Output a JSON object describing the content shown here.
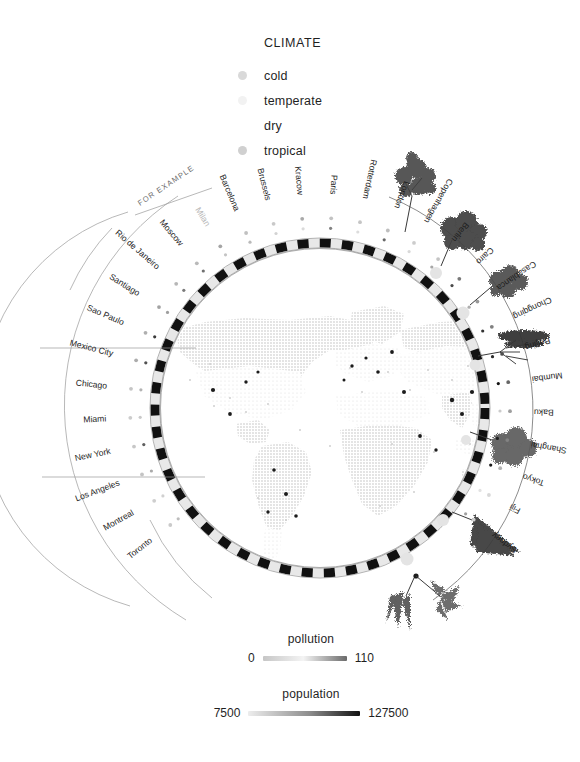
{
  "legend": {
    "title": "CLIMATE",
    "items": [
      {
        "label": "cold",
        "color": "#d9d9d9"
      },
      {
        "label": "temperate",
        "color": "#f2f2f2"
      },
      {
        "label": "dry",
        "color": "#ffffff"
      },
      {
        "label": "tropical",
        "color": "#d0d0d0"
      }
    ]
  },
  "annotation": {
    "for_example": "FOR EXAMPLE"
  },
  "scales": [
    {
      "id": "pollution",
      "caption": "pollution",
      "min_label": "0",
      "max_label": "110",
      "min_value": 0,
      "max_value": 110,
      "gradient_from": "#c6c6c6",
      "gradient_mid": "#f4f4f4",
      "gradient_to": "#6a6a6a"
    },
    {
      "id": "population",
      "caption": "population",
      "min_label": "7500",
      "max_label": "127500",
      "min_value": 7500,
      "max_value": 127500,
      "gradient_from": "#ededed",
      "gradient_mid": "#8d8d8d",
      "gradient_to": "#111111"
    }
  ],
  "chart_data": {
    "type": "radial-map",
    "title": "",
    "center": {
      "x": 320,
      "y": 408
    },
    "ring_radius": 165,
    "legend_position": "top-center",
    "grid": false,
    "metrics": [
      "pollution",
      "population",
      "climate"
    ],
    "cities": [
      {
        "name": "Toronto",
        "group": "Americas",
        "climate": "cold",
        "pollution": 14,
        "population": 29000,
        "dim": false
      },
      {
        "name": "Montreal",
        "group": "Americas",
        "climate": "cold",
        "pollution": 12,
        "population": 18000,
        "dim": false
      },
      {
        "name": "Los Angeles",
        "group": "Americas",
        "climate": "dry",
        "pollution": 18,
        "population": 40000,
        "dim": false
      },
      {
        "name": "New York",
        "group": "Americas",
        "climate": "temperate",
        "pollution": 16,
        "population": 84000,
        "dim": false
      },
      {
        "name": "Miami",
        "group": "Americas",
        "climate": "tropical",
        "pollution": 13,
        "population": 22000,
        "dim": false
      },
      {
        "name": "Chicago",
        "group": "Americas",
        "climate": "cold",
        "pollution": 17,
        "population": 35000,
        "dim": false
      },
      {
        "name": "Mexico City",
        "group": "Americas",
        "climate": "dry",
        "pollution": 32,
        "population": 92000,
        "dim": false
      },
      {
        "name": "Sao Paulo",
        "group": "Americas",
        "climate": "tropical",
        "pollution": 30,
        "population": 105000,
        "dim": false
      },
      {
        "name": "Santiago",
        "group": "Americas",
        "climate": "dry",
        "pollution": 38,
        "population": 47000,
        "dim": false
      },
      {
        "name": "Rio de Janeiro",
        "group": "Americas",
        "climate": "tropical",
        "pollution": 26,
        "population": 68000,
        "dim": false
      },
      {
        "name": "Moscow",
        "group": "Europe",
        "climate": "cold",
        "pollution": 24,
        "population": 74000,
        "dim": false
      },
      {
        "name": "Milan",
        "group": "Europe",
        "climate": "temperate",
        "pollution": 36,
        "population": 25000,
        "dim": true
      },
      {
        "name": "Barcelona",
        "group": "Europe",
        "climate": "temperate",
        "pollution": 20,
        "population": 31000,
        "dim": false
      },
      {
        "name": "Brussels",
        "group": "Europe",
        "climate": "temperate",
        "pollution": 15,
        "population": 17000,
        "dim": false
      },
      {
        "name": "Kracow",
        "group": "Europe",
        "climate": "cold",
        "pollution": 34,
        "population": 12000,
        "dim": false
      },
      {
        "name": "Paris",
        "group": "Europe",
        "climate": "temperate",
        "pollution": 19,
        "population": 64000,
        "dim": false
      },
      {
        "name": "Rotterdam",
        "group": "Europe",
        "climate": "temperate",
        "pollution": 17,
        "population": 11000,
        "dim": false
      },
      {
        "name": "London",
        "group": "Europe",
        "climate": "temperate",
        "pollution": 21,
        "population": 78000,
        "dim": false
      },
      {
        "name": "Copenhagen",
        "group": "Europe",
        "climate": "cold",
        "pollution": 13,
        "population": 13000,
        "dim": false
      },
      {
        "name": "Berlin",
        "group": "Europe",
        "climate": "temperate",
        "pollution": 18,
        "population": 42000,
        "dim": false
      },
      {
        "name": "Cairo",
        "group": "Africa-Asia",
        "climate": "dry",
        "pollution": 62,
        "population": 96000,
        "dim": false
      },
      {
        "name": "Casablanca",
        "group": "Africa-Asia",
        "climate": "dry",
        "pollution": 44,
        "population": 38000,
        "dim": false
      },
      {
        "name": "Chongqing",
        "group": "Africa-Asia",
        "climate": "temperate",
        "pollution": 58,
        "population": 110000,
        "dim": false
      },
      {
        "name": "Beijing",
        "group": "Africa-Asia",
        "climate": "dry",
        "pollution": 88,
        "population": 115000,
        "dim": false
      },
      {
        "name": "Mumbai",
        "group": "Africa-Asia",
        "climate": "tropical",
        "pollution": 74,
        "population": 127500,
        "dim": false
      },
      {
        "name": "Baku",
        "group": "Africa-Asia",
        "climate": "dry",
        "pollution": 40,
        "population": 21000,
        "dim": false
      },
      {
        "name": "Shanghai",
        "group": "Africa-Asia",
        "climate": "temperate",
        "pollution": 56,
        "population": 121000,
        "dim": false
      },
      {
        "name": "Tokyo",
        "group": "Africa-Asia",
        "climate": "temperate",
        "pollution": 28,
        "population": 124000,
        "dim": false
      },
      {
        "name": "Fiji",
        "group": "Oceania",
        "climate": "tropical",
        "pollution": 6,
        "population": 7500,
        "dim": false
      },
      {
        "name": "Sydney",
        "group": "Oceania",
        "climate": "temperate",
        "pollution": 11,
        "population": 46000,
        "dim": false
      }
    ]
  }
}
